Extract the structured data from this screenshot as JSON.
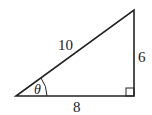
{
  "diagram": {
    "type": "right-triangle",
    "hypotenuse_label": "10",
    "opposite_label": "6",
    "adjacent_label": "8",
    "angle_label": "θ",
    "right_angle_marker": "square",
    "stroke_color": "#222222",
    "background": "#ffffff"
  }
}
